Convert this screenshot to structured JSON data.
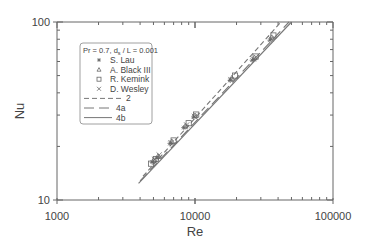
{
  "chart_data": {
    "type": "scatter",
    "title": "",
    "xlabel": "Re",
    "ylabel": "Nu",
    "xscale": "log",
    "yscale": "log",
    "xlim": [
      1000,
      100000
    ],
    "ylim": [
      10,
      100
    ],
    "x_tick_labels": [
      "1000",
      "10000",
      "100000"
    ],
    "y_tick_labels": [
      "10",
      "100"
    ],
    "grid": false,
    "legend_position": "upper left",
    "legend_title": "Pr = 0.7,  d_s / L = 0.001",
    "series": [
      {
        "name": "S. Lau",
        "marker": "asterisk",
        "x": [
          4900,
          5300,
          6600,
          8300,
          9800,
          18000,
          26000,
          35000
        ],
        "y": [
          16.3,
          17.2,
          20.8,
          25.5,
          29.3,
          47,
          61,
          79
        ]
      },
      {
        "name": "A. Black III",
        "marker": "triangle",
        "x": [
          5000,
          5400,
          6800,
          8500,
          10000,
          18500,
          27000,
          36000
        ],
        "y": [
          16.7,
          17.6,
          21.3,
          26,
          29.8,
          48.5,
          63,
          82
        ]
      },
      {
        "name": "R. Kemink",
        "marker": "square",
        "x": [
          4800,
          5200,
          7000,
          9000,
          10200,
          19500,
          27500,
          37000
        ],
        "y": [
          16.0,
          17.0,
          21.6,
          27,
          30.2,
          50,
          64,
          84
        ]
      },
      {
        "name": "D. Wesley",
        "marker": "x",
        "x": [
          5100,
          5500,
          6700,
          8700,
          9900,
          18200,
          26500,
          35500
        ],
        "y": [
          16.9,
          17.9,
          21.0,
          26.4,
          29.5,
          47.5,
          62,
          80.5
        ]
      },
      {
        "name": "2",
        "type": "line",
        "style": "dashed",
        "x": [
          4200,
          42000
        ],
        "y": [
          13.6,
          100
        ]
      },
      {
        "name": "4a",
        "type": "line",
        "style": "long-dash",
        "x": [
          4000,
          48000
        ],
        "y": [
          12.8,
          100
        ]
      },
      {
        "name": "4b",
        "type": "line",
        "style": "solid",
        "x": [
          3900,
          50000
        ],
        "y": [
          12.4,
          100
        ]
      }
    ]
  },
  "axes": {
    "x_title": "Re",
    "y_title": "Nu",
    "x_ticks": [
      "1000",
      "10000",
      "100000"
    ],
    "y_ticks": [
      "10",
      "100"
    ]
  },
  "legend": {
    "title": "Pr = 0.7,  d",
    "title_sub": "s",
    "title_rest": " / L = 0.001",
    "items": [
      "S. Lau",
      "A. Black III",
      "R. Kemink",
      "D. Wesley",
      "2",
      "4a",
      "4b"
    ]
  }
}
